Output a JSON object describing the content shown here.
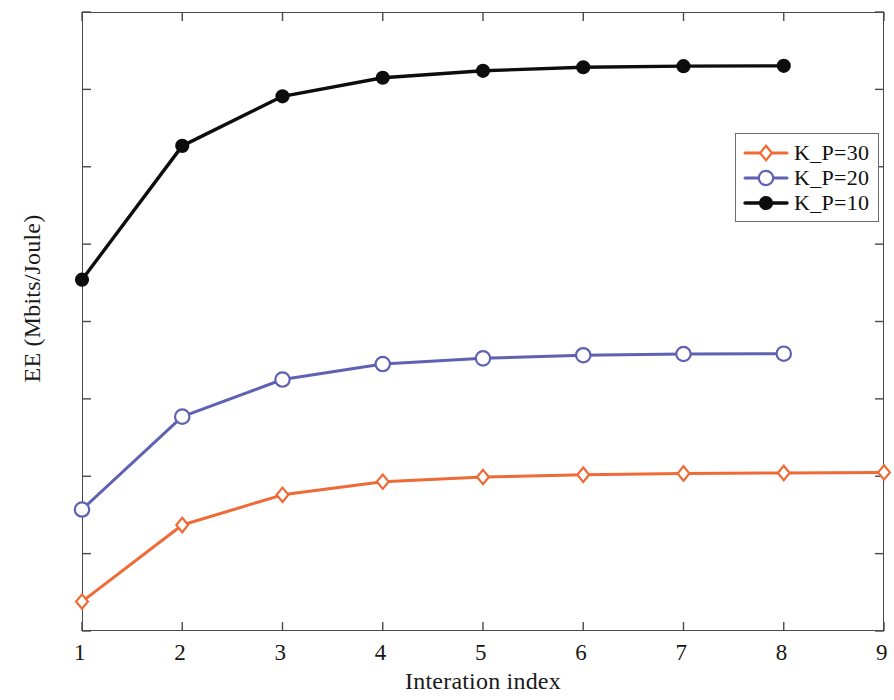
{
  "chart_data": {
    "type": "line",
    "title": "",
    "xlabel": "Interation index",
    "ylabel": "EE (Mbits/Joule)",
    "xlim": [
      1,
      9
    ],
    "ylim": [
      0.25,
      0.65
    ],
    "xticks": [
      "1",
      "2",
      "3",
      "4",
      "5",
      "6",
      "7",
      "8",
      "9"
    ],
    "yticks": [
      "0.25",
      "0.3",
      "0.35",
      "0.4",
      "0.45",
      "0.5",
      "0.55",
      "0.6",
      "0.65"
    ],
    "grid": false,
    "legend_position": "upper right",
    "series": [
      {
        "name": "K_P=30",
        "color": "#ef6a35",
        "marker": "diamond",
        "marker_filled": false,
        "x": [
          1,
          2,
          3,
          4,
          5,
          6,
          7,
          8,
          9
        ],
        "values": [
          0.269,
          0.3185,
          0.338,
          0.3465,
          0.3495,
          0.351,
          0.3518,
          0.3521,
          0.3525
        ]
      },
      {
        "name": "K_P=20",
        "color": "#5f61b2",
        "marker": "circle",
        "marker_filled": false,
        "x": [
          1,
          2,
          3,
          4,
          5,
          6,
          7,
          8
        ],
        "values": [
          0.3285,
          0.3885,
          0.4125,
          0.4225,
          0.4262,
          0.4282,
          0.429,
          0.4292
        ]
      },
      {
        "name": "K_P=10",
        "color": "#0d0d0d",
        "marker": "circle",
        "marker_filled": true,
        "x": [
          1,
          2,
          3,
          4,
          5,
          6,
          7,
          8
        ],
        "values": [
          0.477,
          0.5635,
          0.5955,
          0.6075,
          0.612,
          0.6143,
          0.615,
          0.6152
        ]
      }
    ]
  },
  "legend": {
    "items": [
      {
        "label": "K_P=30"
      },
      {
        "label": "K_P=20"
      },
      {
        "label": "K_P=10"
      }
    ]
  },
  "axes": {
    "ylabel_text": "EE (Mbits/Joule)",
    "xlabel_text": "Interation index"
  }
}
